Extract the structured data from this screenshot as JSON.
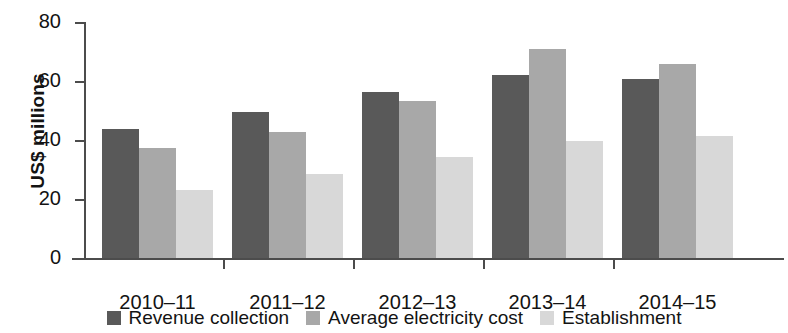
{
  "chart_data": {
    "type": "bar",
    "title": "",
    "xlabel": "",
    "ylabel": "US$ millions",
    "ylim": [
      0,
      80
    ],
    "yticks": [
      0,
      20,
      40,
      60,
      80
    ],
    "grid": false,
    "legend_position": "bottom",
    "categories": [
      "2010–11",
      "2011–12",
      "2012–13",
      "2013–14",
      "2014–15"
    ],
    "series": [
      {
        "name": "Revenue collection",
        "color": "#595959",
        "values": [
          43.8,
          49.5,
          56.2,
          62.2,
          60.8
        ]
      },
      {
        "name": "Average electricity cost",
        "color": "#a8a8a8",
        "values": [
          37.4,
          42.6,
          53.2,
          71.0,
          65.7
        ]
      },
      {
        "name": "Establishment",
        "color": "#d8d8d8",
        "values": [
          23.2,
          28.6,
          34.4,
          39.7,
          41.2
        ]
      }
    ]
  },
  "axis": {
    "y_title": "US$ millions",
    "y_tick_labels": [
      "80",
      "60",
      "40",
      "20",
      "0"
    ],
    "x_tick_labels": [
      "2010–11",
      "2011–12",
      "2012–13",
      "2013–14",
      "2014–15"
    ]
  },
  "legend": {
    "items": [
      {
        "label": "Revenue collection",
        "color": "#595959"
      },
      {
        "label": "Average electricity cost",
        "color": "#a8a8a8"
      },
      {
        "label": "Establishment",
        "color": "#d8d8d8"
      }
    ]
  },
  "colors": {
    "axis": "#4c4c4c",
    "text": "#131313",
    "background": "#ffffff"
  }
}
